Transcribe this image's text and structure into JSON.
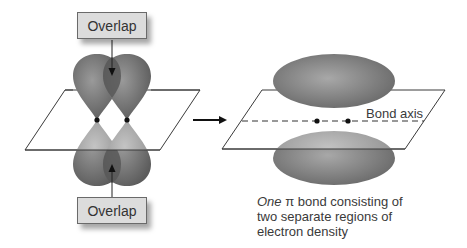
{
  "left_panel": {
    "overlap_top_label": "Overlap",
    "overlap_bottom_label": "Overlap",
    "description": "Two p orbitals side-by-side on adjacent atoms, overlapping above and below the plane"
  },
  "arrow": {
    "direction": "right"
  },
  "right_panel": {
    "axis_label": "Bond axis",
    "caption": {
      "emphasis": "One",
      "symbol": "π",
      "line1_rest": " bond consisting of",
      "line2": "two separate regions of",
      "line3": "electron density"
    }
  },
  "colors": {
    "lobe_dark": "#6e6e6e",
    "lobe_light": "#a8a8a8",
    "overlap_fill": "#5a5a5a",
    "box_fill": "#dcdcdc",
    "plane_stroke": "#3a3a3a",
    "text": "#3a3a3a"
  }
}
